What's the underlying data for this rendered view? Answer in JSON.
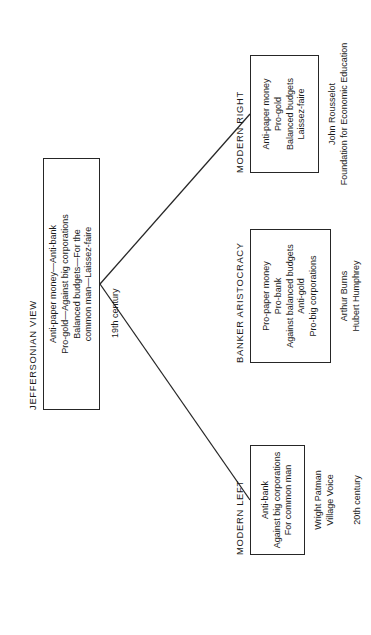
{
  "diagram": {
    "type": "tree",
    "orientation": "rotated-90-counterclockwise",
    "stroke_color": "#262626",
    "background_color": "#ffffff",
    "root": {
      "title": "JEFFERSONIAN VIEW",
      "era": "19th century",
      "lines": [
        "Anti-paper money—Anti-bank",
        "Pro-gold—Against big corporations",
        "Balanced budgets—For the",
        "common man—Laissez-faire"
      ]
    },
    "children": [
      {
        "title": "MODERN LEFT",
        "era": "20th century",
        "lines": [
          "Anti-bank",
          "Against big corporations",
          "For common man"
        ],
        "attribution": [
          "Wright Patman",
          "Village Voice"
        ]
      },
      {
        "title": "BANKER ARISTOCRACY",
        "era": "",
        "lines": [
          "Pro-paper money",
          "Pro-bank",
          "Against balanced budgets",
          "Anti-gold",
          "Pro-big corporations"
        ],
        "attribution": [
          "Arthur Burns",
          "Hubert Humphrey"
        ]
      },
      {
        "title": "MODERN RIGHT",
        "era": "",
        "lines": [
          "Anti-paper money",
          "Pro-gold",
          "Balanced budgets",
          "Laissez-faire"
        ],
        "attribution": [
          "John Rousselot",
          "Foundation for Economic Education"
        ]
      }
    ]
  }
}
